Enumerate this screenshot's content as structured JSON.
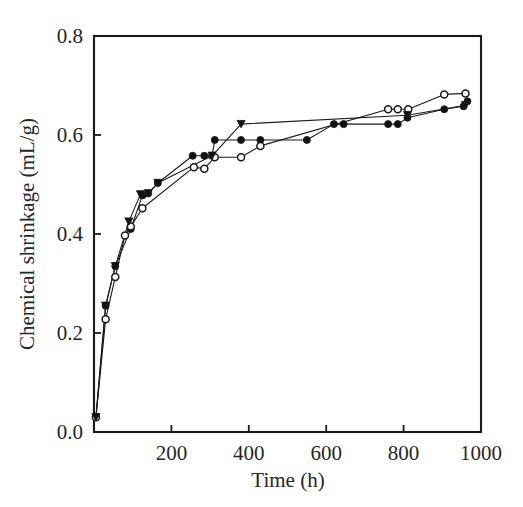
{
  "figure": {
    "background_color": "#ffffff",
    "ink_color": "#1a1a1a"
  },
  "chart_data": {
    "type": "line",
    "title": "",
    "subtitle": "",
    "xlabel": "Time (h)",
    "ylabel": "Chemical shrinkage (mL/g)",
    "xlim": [
      0,
      1000
    ],
    "ylim": [
      0.0,
      0.8
    ],
    "xticks": [
      0,
      200,
      400,
      600,
      800,
      1000
    ],
    "xtick_labels": [
      "",
      "200",
      "400",
      "600",
      "800",
      "1000"
    ],
    "yticks": [
      0.0,
      0.2,
      0.4,
      0.6,
      0.8
    ],
    "ytick_labels": [
      "0.0",
      "0.2",
      "0.4",
      "0.6",
      "0.8"
    ],
    "grid": false,
    "frame": "box",
    "tick_direction": "in",
    "legend": null,
    "legend_position": "none",
    "annotations": [],
    "series": [
      {
        "name": "series-1",
        "marker": "filled-circle",
        "marker_size": 7,
        "color": "#111111",
        "line_color": "#1a1a1a",
        "line_width": 1.1,
        "x": [
          5,
          30,
          55,
          95,
          125,
          140,
          165,
          255,
          285,
          305,
          312,
          380,
          430,
          550,
          620,
          645,
          760,
          785,
          810,
          905,
          955,
          965
        ],
        "y": [
          0.03,
          0.255,
          0.335,
          0.41,
          0.478,
          0.482,
          0.503,
          0.558,
          0.558,
          0.558,
          0.59,
          0.59,
          0.59,
          0.59,
          0.622,
          0.622,
          0.622,
          0.622,
          0.635,
          0.652,
          0.658,
          0.668
        ]
      },
      {
        "name": "series-2",
        "marker": "open-circle",
        "marker_size": 7,
        "color": "#ffffff",
        "line_color": "#1a1a1a",
        "line_width": 1.1,
        "x": [
          5,
          30,
          55,
          80,
          95,
          125,
          258,
          285,
          312,
          380,
          430,
          760,
          785,
          812,
          905,
          960
        ],
        "y": [
          0.03,
          0.228,
          0.313,
          0.397,
          0.415,
          0.452,
          0.535,
          0.532,
          0.555,
          0.555,
          0.578,
          0.652,
          0.652,
          0.652,
          0.682,
          0.684
        ]
      },
      {
        "name": "series-3",
        "marker": "filled-down-triangle",
        "marker_size": 8,
        "color": "#111111",
        "line_color": "#1a1a1a",
        "line_width": 1.1,
        "x": [
          5,
          30,
          55,
          90,
          120,
          140,
          165,
          305,
          380,
          810,
          960
        ],
        "y": [
          0.03,
          0.255,
          0.335,
          0.425,
          0.48,
          0.482,
          0.503,
          0.558,
          0.622,
          0.64,
          0.66
        ]
      }
    ]
  }
}
